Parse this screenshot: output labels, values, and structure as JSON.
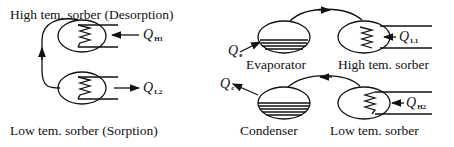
{
  "left_panel": {
    "top_label": "High tem. sorber (Desorption)",
    "bottom_label": "Low tem. sorber (Sorption)",
    "heat_top": {
      "symbol": "Q",
      "sub": "H1",
      "direction": "in"
    },
    "heat_bottom": {
      "symbol": "Q",
      "sub": "L2",
      "direction": "out"
    }
  },
  "right_top": {
    "vessel_left_label": "Evaporator",
    "vessel_right_label": "High tem. sorber",
    "heat_left": {
      "symbol": "Q",
      "sub": "e",
      "direction": "in"
    },
    "heat_right": {
      "symbol": "Q",
      "sub": "L1",
      "direction": "out"
    }
  },
  "right_bottom": {
    "vessel_left_label": "Condenser",
    "vessel_right_label": "Low tem. sorber",
    "heat_left": {
      "symbol": "Q",
      "sub": "c",
      "direction": "out"
    },
    "heat_right": {
      "symbol": "Q",
      "sub": "H2",
      "direction": "in"
    }
  },
  "colors": {
    "line": "#111111",
    "background": "#ffffff"
  }
}
